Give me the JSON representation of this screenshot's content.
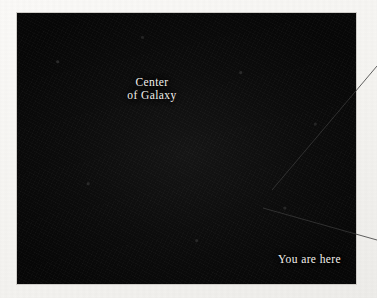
{
  "figure": {
    "kind": "astronomical-photograph",
    "medium": "printed-halftone-scan",
    "page_background": "#f8f7f5",
    "plate_background": "#090909",
    "plate_rect": {
      "x": 17,
      "y": 13,
      "width": 339,
      "height": 271
    }
  },
  "labels": {
    "center_line1": "Center",
    "center_line2": "of Galaxy",
    "you_are_here": "You are here",
    "text_color": "#f2f0ec"
  },
  "markers": {
    "galactic_center": {
      "x": 184,
      "y": 141,
      "style": "small-ring-with-bright-core"
    },
    "solar_position": {
      "x": 256,
      "y": 206,
      "style": "arrow-tip"
    }
  },
  "arrows": {
    "center_arrow": {
      "name": "center-of-galaxy-arrow",
      "from": {
        "x": 136,
        "y": 96
      },
      "to": {
        "x": 177,
        "y": 134
      },
      "color": "#f0eeea"
    },
    "you_are_here_arrow": {
      "name": "you-are-here-arrow",
      "from": {
        "x": 275,
        "y": 238
      },
      "to": {
        "x": 257,
        "y": 209
      },
      "color": "#f0eeea"
    }
  },
  "leader_lines": [
    {
      "name": "upper-leader-line",
      "from": {
        "x": 377,
        "y": 66
      },
      "to": {
        "x": 272,
        "y": 190
      },
      "color": "#3a3a3a",
      "width": 0.8
    },
    {
      "name": "lower-leader-line",
      "from": {
        "x": 377,
        "y": 240
      },
      "to": {
        "x": 263,
        "y": 208
      },
      "color": "#3a3a3a",
      "width": 0.8
    }
  ],
  "spiral_arms": {
    "count": 8,
    "color": "#e9e7e2",
    "description": "grainy white spiral arms winding counter-clockwise out from a dark nucleus"
  }
}
